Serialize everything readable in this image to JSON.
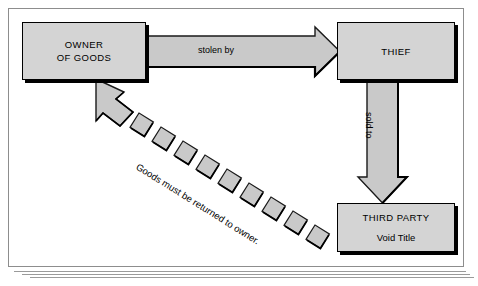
{
  "diagram": {
    "nodes": [
      {
        "id": "owner",
        "title": "OWNER\nOF GOODS",
        "subtitle": ""
      },
      {
        "id": "thief",
        "title": "THIEF",
        "subtitle": ""
      },
      {
        "id": "third-party",
        "title": "THIRD PARTY",
        "subtitle": "Void Title"
      }
    ],
    "edges": [
      {
        "id": "stolen-by",
        "label": "stolen by",
        "from": "owner",
        "to": "thief",
        "style": "solid-block-arrow",
        "direction": "right"
      },
      {
        "id": "sold-to",
        "label": "sold to",
        "from": "thief",
        "to": "third-party",
        "style": "solid-block-arrow",
        "direction": "down"
      },
      {
        "id": "goods-returned",
        "label": "Goods must be returned to owner.",
        "from": "third-party",
        "to": "owner",
        "style": "dashed-block-arrow",
        "direction": "up-left"
      }
    ],
    "colors": {
      "fill": "#d4d4d4",
      "stroke": "#000000",
      "arrow_fill": "#c9c9c9",
      "arrow_stroke": "#1a1a1a",
      "frame": "#8d8d8d",
      "background": "#ffffff"
    }
  }
}
